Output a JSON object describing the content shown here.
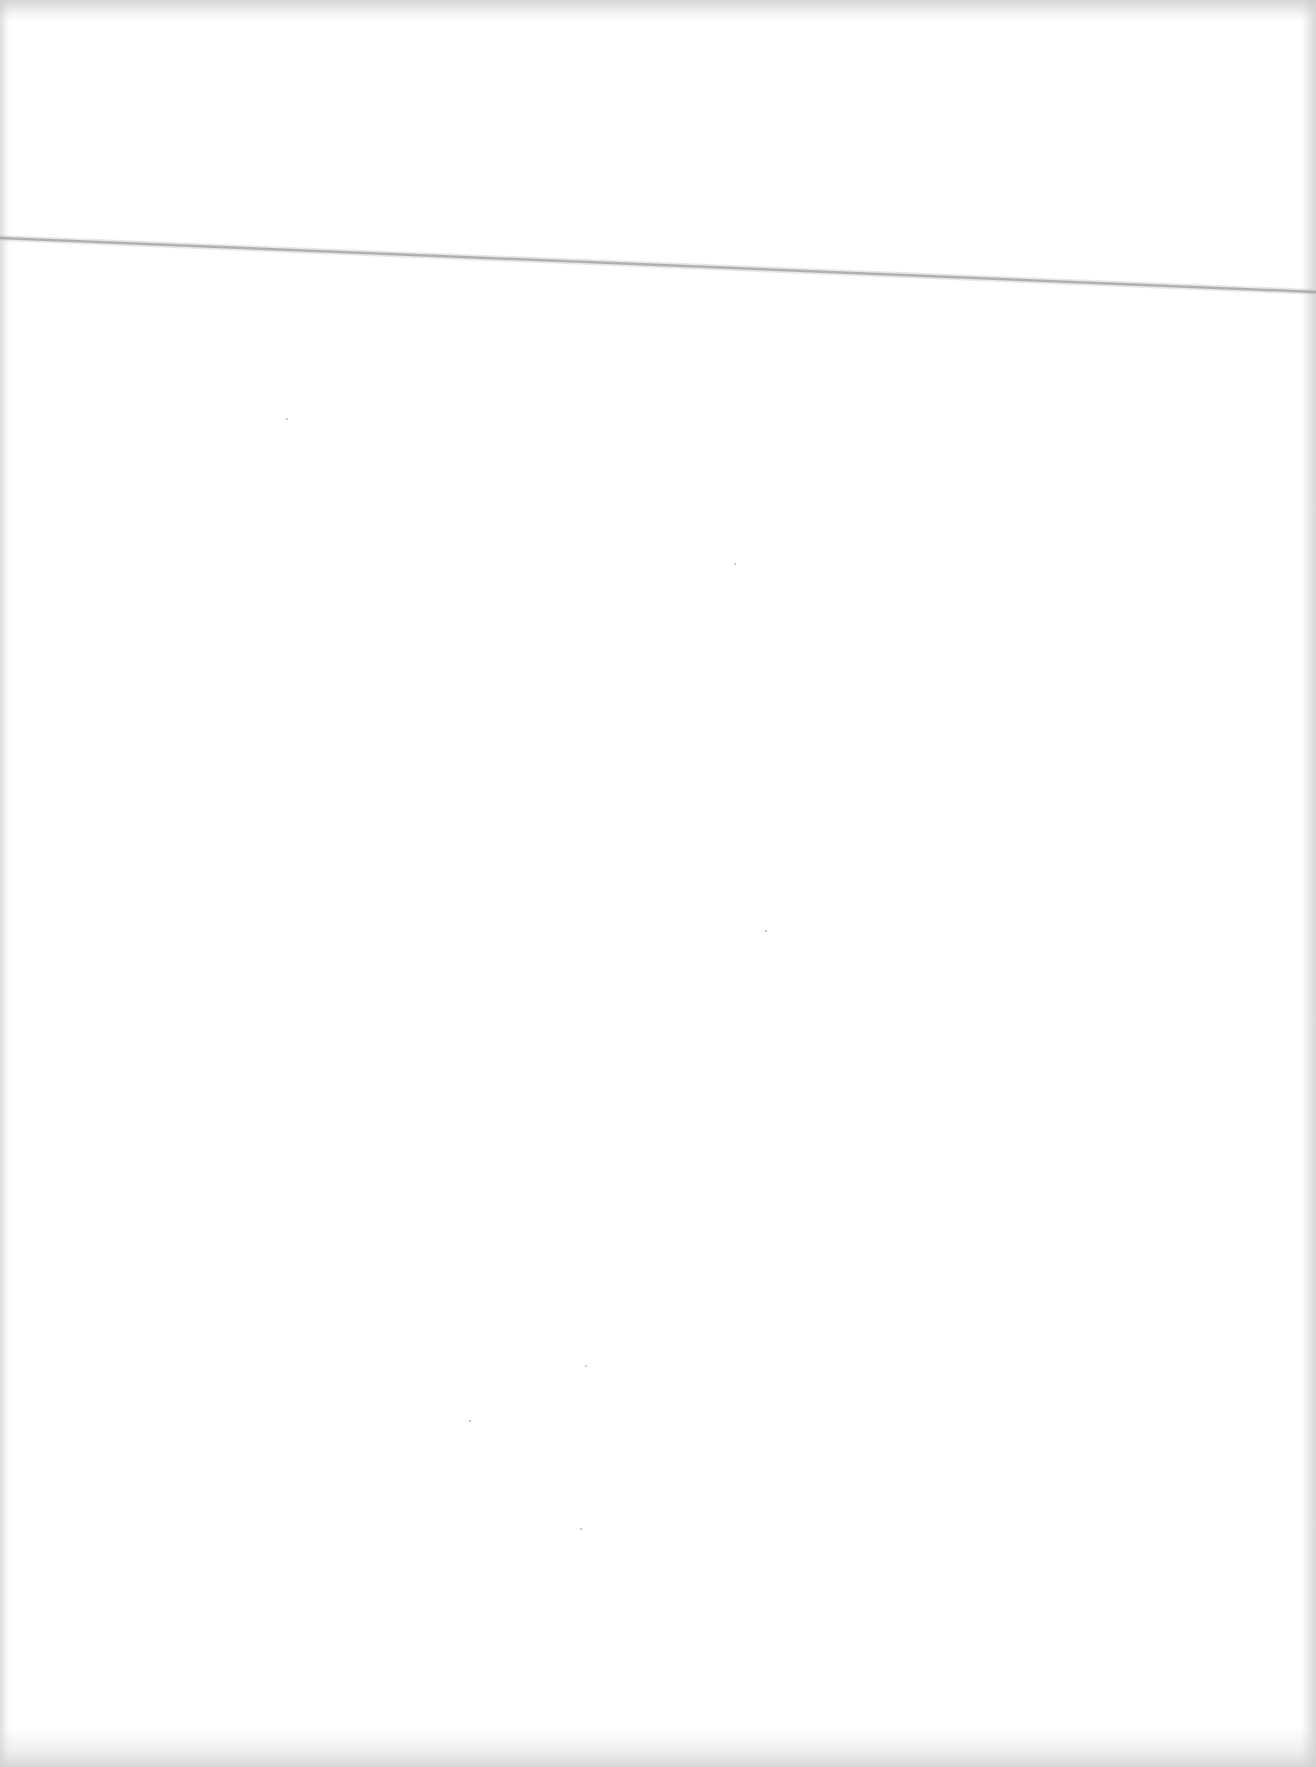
{
  "document": {
    "type": "blank-scanned-page",
    "text_content": "",
    "background_color": "#ffffff",
    "crease_line": {
      "color": "#a9a9a9",
      "start": [
        0,
        238
      ],
      "end": [
        1316,
        292
      ]
    }
  }
}
